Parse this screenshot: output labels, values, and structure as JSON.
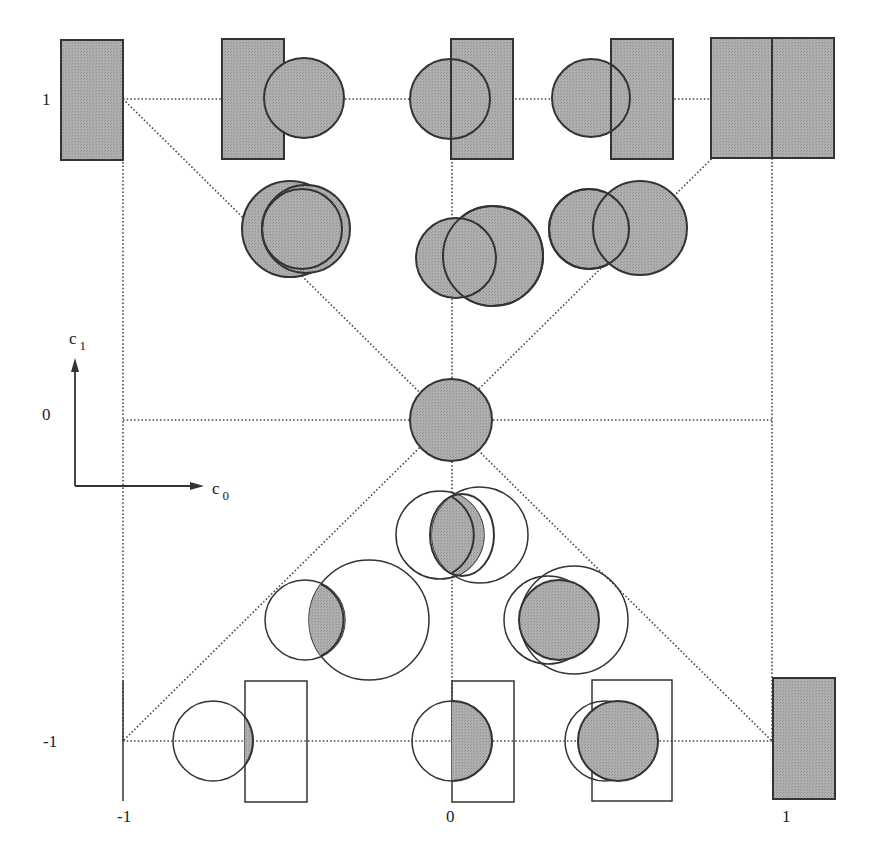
{
  "figure": {
    "type": "lattice diagram of geometric shapes (rectangles and circles) in the (c0, c1) parameter plane",
    "colors": {
      "fill": "#a8a8a8",
      "stroke": "#333333",
      "grid_line": "#444444",
      "background": "#ffffff"
    }
  },
  "axes": {
    "x_label": "c",
    "x_label_sub": "0",
    "y_label": "c",
    "y_label_sub": "1",
    "x_ticks": [
      "-1",
      "0",
      "1"
    ],
    "y_ticks": [
      "1",
      "0",
      "-1"
    ]
  },
  "grid_points": [
    {
      "c0": -1,
      "c1": 1,
      "shape": "filled rectangle"
    },
    {
      "c0": -0.5,
      "c1": 1,
      "shape": "filled rectangle + filled circle"
    },
    {
      "c0": 0,
      "c1": 1,
      "shape": "filled circle + filled rectangle"
    },
    {
      "c0": 0.5,
      "c1": 1,
      "shape": "filled circle + filled rectangle"
    },
    {
      "c0": 1,
      "c1": 1,
      "shape": "two filled rectangles"
    },
    {
      "c0": -0.5,
      "c1": 0.5,
      "shape": "two filled circles"
    },
    {
      "c0": 0,
      "c1": 0.5,
      "shape": "two filled circles"
    },
    {
      "c0": 0.5,
      "c1": 0.5,
      "shape": "two filled circles"
    },
    {
      "c0": 0,
      "c1": 0,
      "shape": "filled circle"
    },
    {
      "c0": 0,
      "c1": -0.5,
      "shape": "intersection lens of two circles"
    },
    {
      "c0": -0.5,
      "c1": -0.5,
      "shape": "intersection lens of two circles"
    },
    {
      "c0": 0.5,
      "c1": -0.5,
      "shape": "circle inside circle intersection"
    },
    {
      "c0": -0.5,
      "c1": -1,
      "shape": "circle/rectangle intersection sliver"
    },
    {
      "c0": 0,
      "c1": -1,
      "shape": "circle/rectangle half-circle intersection"
    },
    {
      "c0": 0.5,
      "c1": -1,
      "shape": "circle inside rectangle"
    },
    {
      "c0": 1,
      "c1": -1,
      "shape": "filled rectangle"
    }
  ]
}
